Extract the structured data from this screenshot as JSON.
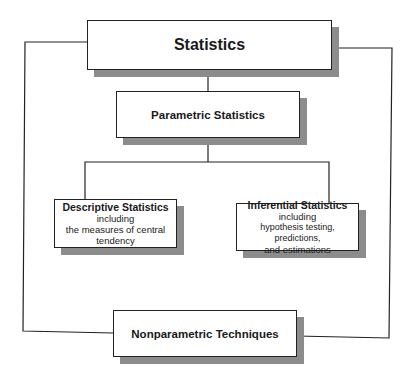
{
  "diagram": {
    "root": {
      "label": "Statistics"
    },
    "parametric": {
      "label": "Parametric Statistics"
    },
    "descriptive": {
      "label": "Descriptive Statistics",
      "sub1": "including",
      "sub2": "the measures of central",
      "sub3": "tendency"
    },
    "inferential": {
      "label": "Inferential Statistics",
      "sub1": "including",
      "sub2": "hypothesis testing, predictions,",
      "sub3": "and estimations"
    },
    "nonparametric": {
      "label": "Nonparametric Techniques"
    },
    "colors": {
      "line": "#222222",
      "shadow": "#8c8c8c",
      "box_fill": "#ffffff"
    }
  }
}
